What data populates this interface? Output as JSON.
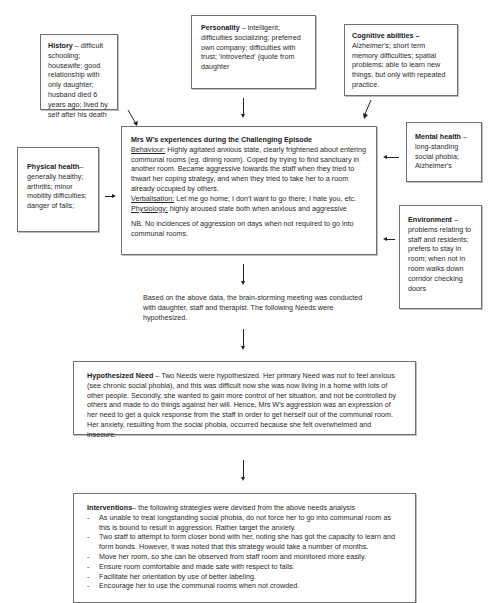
{
  "history": {
    "title": "History",
    "text": " – difficult schooling; housewife; good relationship with only daughter; husband died 6 years ago; lived by self after his death"
  },
  "personality": {
    "title": "Personality",
    "text": " – intelligent; difficulties socializing; preferred own company; difficulties with trust; 'introverted' (quote from daughter"
  },
  "cognitive": {
    "title": "Cognitive abilities –",
    "text": "Alzheimer's; short term memory difficulties; spatial problems; able to learn new things, but only with repeated practice."
  },
  "physical": {
    "title": "Physical health",
    "text": "– generally healthy; arthritis; minor mobility difficulties; danger of falls;"
  },
  "mental": {
    "title": "Mental health",
    "text": " – long-standing social phobia; Alzheimer's"
  },
  "environment": {
    "title": "Environment",
    "text": " – problems relating to staff and residents; prefers to stay in room; when not in room walks down corridor checking doors"
  },
  "episode": {
    "title": "Mrs W's experiences during the Challenging Episode",
    "behaviour_label": "Behaviour:",
    "behaviour_text": " Highly agitated anxious state, clearly frightened about entering communal rooms (eg. dining room). Coped by trying to find sanctuary in another room. Became aggressive towards the staff when they tried to thwart her coping strategy, and when they tried to take her to a room already occupied by others.",
    "verbalisation_label": "Verbalisation:",
    "verbalisation_text": " Let me go home; I don't want to go there; I hate you, etc.",
    "physiology_label": "Physiology:",
    "physiology_text": " highly aroused state both when anxious and aggressive",
    "nb": "NB. No incidences of aggression on days when not required to go into communal rooms."
  },
  "meeting": {
    "text": "Based on the above data, the brain-storming meeting was conducted with daughter, staff and therapist. The following Needs were hypothesized."
  },
  "needs": {
    "title": "Hypothesized Need",
    "text": " – Two Needs were hypothesized. Her primary Need was not to feel anxious (see chronic social phobia), and this was difficult now she was now living in a home with lots of other people. Secondly, she wanted to gain more control of her situation, and not be controlled by others and made to do things against her will. Hence, Mrs W's aggression was an expression of her need to get a quick response from the staff in order to get herself out of the communal room. Her anxiety, resulting from the social phobia, occurred because she felt overwhelmed and insecure."
  },
  "interventions": {
    "title": "Interventions",
    "intro": "– the following strategies were devised from the above needs analysis",
    "items": [
      "As unable to treat longstanding social phobia, do not force her to go into communal room as this is bound to result in aggression. Rather target the anxiety.",
      "Two staff to attempt to form closer bond with her, noting she has got the capacity to learn and form bonds. However, it was noted that this strategy would take a number of months.",
      "Move her room, so she can be observed from staff room and monitored more easily.",
      "Ensure room comfortable and made safe with respect to falls.",
      "Facilitate her orientation by use of better labeling.",
      "Encourage her to use the communal rooms when not crowded."
    ]
  }
}
